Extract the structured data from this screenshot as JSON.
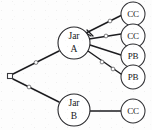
{
  "figure": {
    "type": "probability-tree-diagram",
    "title": "",
    "background_color": "#fdfdfd",
    "line_color": "#1d1d20",
    "node_fill": "#ffffff"
  },
  "nodes": {
    "root": {
      "id": "root",
      "label": "",
      "shape": "small-square",
      "x": 10,
      "y": 76,
      "size": 5
    },
    "jars": [
      {
        "id": "jar-a",
        "label_line1": "Jar",
        "label_line2": "A",
        "x": 74,
        "y": 43,
        "r": 16
      },
      {
        "id": "jar-b",
        "label_line1": "Jar",
        "label_line2": "B",
        "x": 74,
        "y": 110,
        "r": 16
      }
    ],
    "leaves": [
      {
        "id": "leaf-a-1",
        "label": "CC",
        "x": 133,
        "y": 14,
        "r": 12,
        "parent": "jar-a"
      },
      {
        "id": "leaf-a-2",
        "label": "CC",
        "x": 133,
        "y": 36,
        "r": 12,
        "parent": "jar-a"
      },
      {
        "id": "leaf-a-3",
        "label": "PB",
        "x": 133,
        "y": 56,
        "r": 12,
        "parent": "jar-a"
      },
      {
        "id": "leaf-a-4",
        "label": "PB",
        "x": 133,
        "y": 77,
        "r": 12,
        "parent": "jar-a"
      },
      {
        "id": "leaf-b-1",
        "label": "CC",
        "x": 133,
        "y": 111,
        "r": 12,
        "parent": "jar-b"
      }
    ]
  },
  "edges": [
    {
      "id": "edge-root-jar-a",
      "from": "root",
      "to": "jar-a",
      "label": "",
      "has_marker": true
    },
    {
      "id": "edge-root-jar-b",
      "from": "root",
      "to": "jar-b",
      "label": "",
      "has_marker": true
    },
    {
      "id": "edge-jar-a-leaf-1",
      "from": "jar-a",
      "to": "leaf-a-1",
      "label": "",
      "has_marker": true
    },
    {
      "id": "edge-jar-a-leaf-2",
      "from": "jar-a",
      "to": "leaf-a-2",
      "label": "",
      "has_marker": true
    },
    {
      "id": "edge-jar-a-leaf-3",
      "from": "jar-a",
      "to": "leaf-a-3",
      "label": "",
      "has_marker": false
    },
    {
      "id": "edge-jar-a-leaf-4",
      "from": "jar-a",
      "to": "leaf-a-4",
      "label": "",
      "has_marker": true
    },
    {
      "id": "edge-jar-b-leaf-1",
      "from": "jar-b",
      "to": "leaf-b-1",
      "label": "",
      "has_marker": false
    }
  ]
}
